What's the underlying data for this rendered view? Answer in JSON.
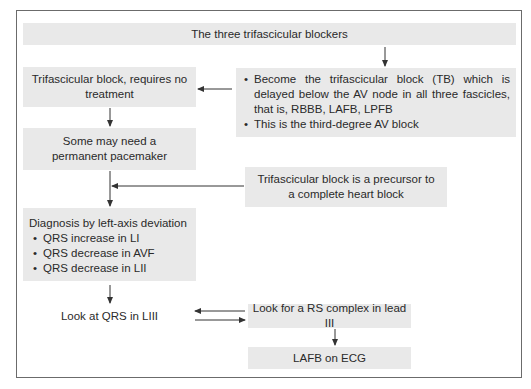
{
  "diagram": {
    "title": "The three trifascicular blockers",
    "nodes": {
      "no_treatment": "Trifascicular block, requires no treatment",
      "tb_definition": {
        "bullets": [
          "Become the trifascicular block (TB) which is delayed below the AV node in all three fascicles, that is, RBBB, LAFB, LPFB",
          "This is the third-degree AV block"
        ]
      },
      "pacemaker": "Some may need a permanent pacemaker",
      "precursor": "Trifascicular block is a precursor to a complete heart block",
      "diagnosis": {
        "heading": "Diagnosis by left-axis deviation",
        "bullets": [
          "QRS increase in LI",
          "QRS decrease in AVF",
          "QRS decrease in LII"
        ]
      },
      "look_qrs": "Look at QRS in LIII",
      "rs_complex": "Look for a RS complex in lead III",
      "result": "LAFB on ECG"
    },
    "edges": [
      {
        "from": "title",
        "to": "tb_definition"
      },
      {
        "from": "tb_definition",
        "to": "no_treatment"
      },
      {
        "from": "no_treatment",
        "to": "pacemaker"
      },
      {
        "from": "pacemaker",
        "to": "diagnosis"
      },
      {
        "from": "precursor",
        "to": "pacemaker-diagnosis-link"
      },
      {
        "from": "diagnosis",
        "to": "look_qrs"
      },
      {
        "from": "rs_complex",
        "to": "look_qrs"
      },
      {
        "from": "look_qrs",
        "to": "rs_complex"
      },
      {
        "from": "rs_complex",
        "to": "result"
      }
    ],
    "colors": {
      "box_fill": "#e9e9e9",
      "border": "#6b6b6b",
      "arrow": "#333333",
      "text": "#2a2a2a"
    }
  }
}
